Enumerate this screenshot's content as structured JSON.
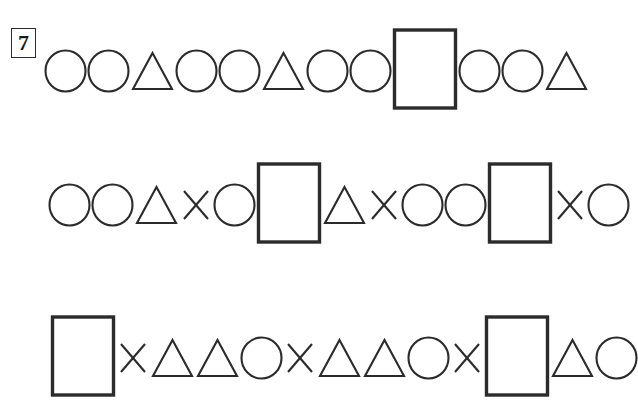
{
  "worksheet": {
    "question_number": "7",
    "background_color": "#ffffff",
    "stroke_color": "#2b2b2b",
    "shape_glyphs": {
      "circle": "○",
      "triangle": "△",
      "cross": "×",
      "rectangle": "□"
    },
    "rows": [
      {
        "id": "row-1",
        "label": "sequence-row-1",
        "pattern_text": "○ ○ △ ○ ○ △ ○ ○ □ ○ ○ △",
        "shapes": [
          "circle",
          "circle",
          "triangle",
          "circle",
          "circle",
          "triangle",
          "circle",
          "circle",
          "rectangle",
          "circle",
          "circle",
          "triangle"
        ]
      },
      {
        "id": "row-2",
        "label": "sequence-row-2",
        "pattern_text": "○ ○ △ × ○ □ △ × ○ ○ □ × ○",
        "shapes": [
          "circle",
          "circle",
          "triangle",
          "cross",
          "circle",
          "rectangle",
          "triangle",
          "cross",
          "circle",
          "circle",
          "rectangle",
          "cross",
          "circle"
        ]
      },
      {
        "id": "row-3",
        "label": "sequence-row-3",
        "pattern_text": "□ × △ △ ○ × △ △ ○ × □ △ ○",
        "shapes": [
          "rectangle",
          "cross",
          "triangle",
          "triangle",
          "circle",
          "cross",
          "triangle",
          "triangle",
          "circle",
          "cross",
          "rectangle",
          "triangle",
          "circle"
        ]
      }
    ]
  }
}
